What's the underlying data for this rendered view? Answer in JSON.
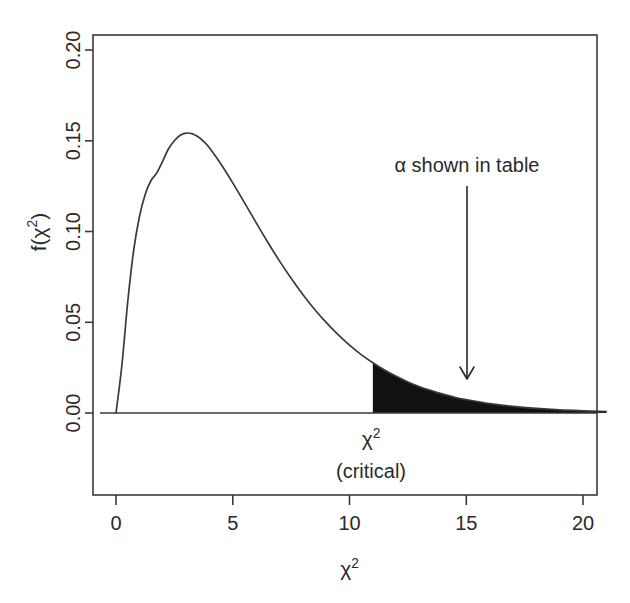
{
  "figure": {
    "name": "chi-square-critical-region-plot",
    "background_color": "#ffffff",
    "ink_color": "#3a3a3a",
    "fill_color": "#111111"
  },
  "axes": {
    "y_label_main": "f(",
    "y_label_chi": "χ",
    "y_label_exp": "2",
    "y_label_close": ")",
    "y_label_full": "f(χ²)",
    "x_label_chi": "χ",
    "x_label_exp": "2",
    "x_label_full": "χ²",
    "x_ticks": [
      "0",
      "5",
      "10",
      "15",
      "20"
    ],
    "y_ticks": [
      "0.00",
      "0.05",
      "0.10",
      "0.15",
      "0.20"
    ]
  },
  "annotations": {
    "alpha_note": "α shown in table",
    "critical_chi": "χ",
    "critical_exp": "2",
    "critical_word": "(critical)",
    "critical_full": "χ² (critical)"
  },
  "chart_data": {
    "type": "line",
    "title": "",
    "subtitle": "",
    "xlabel": "χ²",
    "ylabel": "f(χ²)",
    "xlim": [
      0,
      21
    ],
    "ylim": [
      0.0,
      0.21
    ],
    "x_ticks": [
      0,
      5,
      10,
      15,
      20
    ],
    "y_ticks": [
      0.0,
      0.05,
      0.1,
      0.15,
      0.2
    ],
    "grid": false,
    "legend": "none",
    "distribution": "chi-square",
    "degrees_of_freedom": 5,
    "peak": {
      "x": 3.0,
      "y": 0.1542
    },
    "critical_value": {
      "x": 11.0,
      "y": 0.0206,
      "label": "χ² (critical)"
    },
    "shaded_region": {
      "from": 11.0,
      "to": 21.0,
      "label": "α shown in table",
      "fill": "#111111"
    },
    "annotation_arrow": {
      "x": 14.0,
      "from_y": 0.128,
      "to_y": 0.019
    },
    "series": [
      {
        "name": "chi-square df=5 density",
        "x": [
          0.0,
          0.25,
          0.5,
          0.75,
          1.0,
          1.25,
          1.5,
          1.75,
          2.0,
          2.25,
          2.5,
          2.75,
          3.0,
          3.25,
          3.5,
          3.75,
          4.0,
          4.5,
          5.0,
          5.5,
          6.0,
          6.5,
          7.0,
          7.5,
          8.0,
          8.5,
          9.0,
          9.5,
          10.0,
          10.5,
          11.0,
          11.5,
          12.0,
          12.5,
          13.0,
          13.5,
          14.0,
          14.5,
          15.0,
          16.0,
          17.0,
          18.0,
          19.0,
          20.0,
          21.0
        ],
        "y": [
          0.0,
          0.0261,
          0.0609,
          0.089,
          0.108,
          0.1204,
          0.1281,
          0.1323,
          0.1388,
          0.1456,
          0.15,
          0.153,
          0.1542,
          0.1539,
          0.1523,
          0.1497,
          0.1462,
          0.1371,
          0.1268,
          0.1159,
          0.1049,
          0.0941,
          0.0838,
          0.0742,
          0.0653,
          0.0572,
          0.0499,
          0.0433,
          0.0374,
          0.0322,
          0.0277,
          0.0237,
          0.0202,
          0.0171,
          0.0145,
          0.0123,
          0.0104,
          0.0087,
          0.0074,
          0.0052,
          0.0036,
          0.0025,
          0.0017,
          0.0012,
          0.0008
        ]
      }
    ]
  }
}
